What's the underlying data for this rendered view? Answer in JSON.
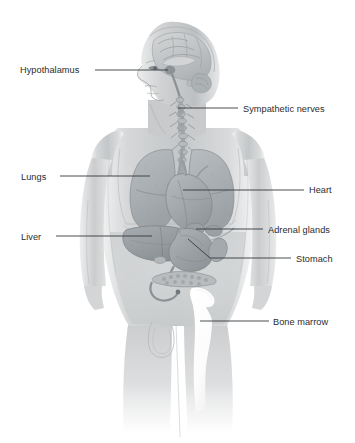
{
  "figure": {
    "background_color": "#ffffff",
    "label_color": "#2b2b2b",
    "leader_line_color": "#33383c",
    "body_tone_color": "#c9cbcc",
    "organ_tone_color": "#9aa0a3",
    "bone_marrow_highlight_color": "#fdfdfd",
    "width": 355,
    "height": 443
  },
  "labels": [
    {
      "id": "hypothalamus",
      "text": "Hypothalamus",
      "side": "left",
      "text_x": 20,
      "text_y": 73,
      "anchor": "start",
      "leader": "M 95 70 L 168 70",
      "target": "brain-hypothalamus"
    },
    {
      "id": "sympathetic-nerves",
      "text": "Sympathetic nerves",
      "side": "right",
      "text_x": 243,
      "text_y": 112,
      "anchor": "start",
      "leader": "M 178 108 L 238 108",
      "target": "sympathetic-chain"
    },
    {
      "id": "lungs",
      "text": "Lungs",
      "side": "left",
      "text_x": 21,
      "text_y": 180,
      "anchor": "start",
      "leader": "M 60 176 L 150 176",
      "target": "lung-left"
    },
    {
      "id": "heart",
      "text": "Heart",
      "side": "right",
      "text_x": 309,
      "text_y": 193,
      "anchor": "start",
      "leader": "M 183 190 L 304 190",
      "target": "heart-organ"
    },
    {
      "id": "liver",
      "text": "Liver",
      "side": "left",
      "text_x": 21,
      "text_y": 240,
      "anchor": "start",
      "leader": "M 56 236 L 152 236",
      "target": "liver-organ"
    },
    {
      "id": "adrenal-glands",
      "text": "Adrenal glands",
      "side": "right",
      "text_x": 268,
      "text_y": 233,
      "anchor": "start",
      "leader": "M 196 229 L 263 229",
      "target": "adrenal-gland"
    },
    {
      "id": "stomach",
      "text": "Stomach",
      "side": "right",
      "text_x": 296,
      "text_y": 262,
      "anchor": "start",
      "leader": "M 188 239 L 210 258 L 291 258",
      "target": "stomach-organ"
    },
    {
      "id": "bone-marrow",
      "text": "Bone marrow",
      "side": "right",
      "text_x": 273,
      "text_y": 325,
      "anchor": "start",
      "leader": "M 200 321 L 269 321",
      "target": "bone-marrow-region"
    }
  ],
  "anatomy": {
    "head": "left-facing profile with sagittal brain section",
    "parts": [
      "brain",
      "hypothalamus",
      "spinal-cord",
      "sympathetic-chain",
      "lung-left",
      "lung-right",
      "heart",
      "diaphragm",
      "liver",
      "stomach",
      "pancreas",
      "intestine",
      "adrenal-gland",
      "pelvis-bone-marrow",
      "arms",
      "legs"
    ]
  }
}
